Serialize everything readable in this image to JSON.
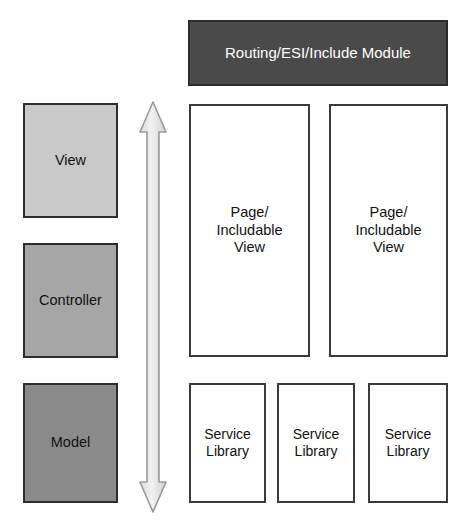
{
  "diagram": {
    "colors": {
      "view_fill": "#c9c9c9",
      "controller_fill": "#a6a6a6",
      "model_fill": "#8a8a8a",
      "routing_fill": "#4a4a4a",
      "routing_text": "#ffffff",
      "box_border": "#2d2d2d",
      "plain_box_fill": "#ffffff",
      "arrow_fill": "#e8e8e8",
      "arrow_stroke": "#8f8f8f",
      "background": "#ffffff"
    },
    "mvc_column": {
      "items": [
        {
          "label": "View",
          "fill": "#c9c9c9"
        },
        {
          "label": "Controller",
          "fill": "#a6a6a6"
        },
        {
          "label": "Model",
          "fill": "#8a8a8a"
        }
      ]
    },
    "arrow": {
      "name": "vertical-double-arrow",
      "direction": "both",
      "orientation": "vertical"
    },
    "routing_module": {
      "label": "Routing/ESI/Include Module"
    },
    "page_views": {
      "items": [
        {
          "label": "Page/\nIncludable\nView"
        },
        {
          "label": "Page/\nIncludable\nView"
        }
      ]
    },
    "service_libraries": {
      "items": [
        {
          "label": "Service\nLibrary"
        },
        {
          "label": "Service\nLibrary"
        },
        {
          "label": "Service\nLibrary"
        }
      ]
    }
  }
}
